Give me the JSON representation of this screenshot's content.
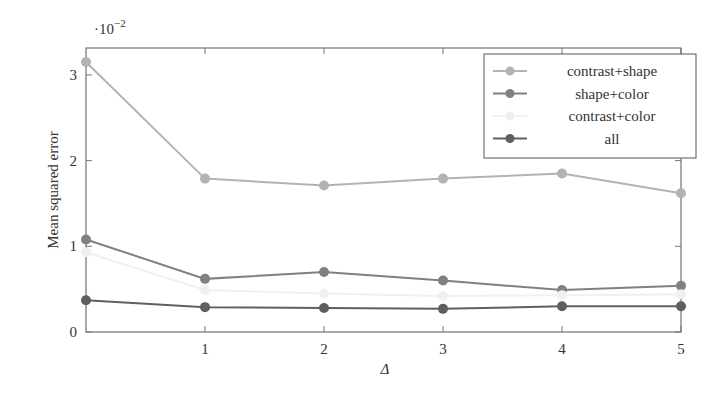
{
  "chart_data": {
    "type": "line",
    "title": "",
    "xlabel": "Δ",
    "ylabel": "Mean squared error",
    "y_scale_note": "·10⁻²",
    "x": [
      0,
      1,
      2,
      3,
      4,
      5
    ],
    "x_ticks": [
      1,
      2,
      3,
      4,
      5
    ],
    "y_ticks": [
      0,
      1,
      2,
      3
    ],
    "xlim": [
      0,
      5
    ],
    "ylim": [
      0,
      3.3
    ],
    "grid": false,
    "legend_position": "top-right",
    "series": [
      {
        "name": "contrast+shape",
        "color": "#b3b3b3",
        "values": [
          3.15,
          1.79,
          1.71,
          1.79,
          1.85,
          1.62
        ]
      },
      {
        "name": "shape+color",
        "color": "#808080",
        "values": [
          1.08,
          0.62,
          0.7,
          0.6,
          0.49,
          0.54
        ]
      },
      {
        "name": "contrast+color",
        "color": "#f0f0f0",
        "values": [
          0.93,
          0.49,
          0.45,
          0.42,
          0.43,
          0.44
        ]
      },
      {
        "name": "all",
        "color": "#5f5f5f",
        "values": [
          0.37,
          0.29,
          0.28,
          0.27,
          0.3,
          0.3
        ]
      }
    ]
  },
  "axes": {
    "x_label": "Δ",
    "y_label": "Mean squared error",
    "y_multiplier": "·10",
    "y_multiplier_exp": "−2",
    "x_tick_labels": [
      "1",
      "2",
      "3",
      "4",
      "5"
    ],
    "y_tick_labels": [
      "0",
      "1",
      "2",
      "3"
    ]
  },
  "legend": {
    "items": [
      {
        "label": "contrast+shape"
      },
      {
        "label": "shape+color"
      },
      {
        "label": "contrast+color"
      },
      {
        "label": "all"
      }
    ]
  }
}
